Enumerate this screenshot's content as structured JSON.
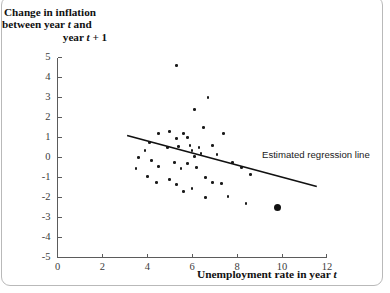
{
  "figure": {
    "y_axis_title_line1": "Change in inflation",
    "y_axis_title_line2_a": "between year ",
    "y_axis_title_line2_t": "t",
    "y_axis_title_line2_b": " and",
    "y_axis_title_line3_a": "year ",
    "y_axis_title_line3_t": "t",
    "y_axis_title_line3_b": " + 1",
    "x_axis_title_a": "Unemployment rate in year ",
    "x_axis_title_t": "t",
    "annotation": "Estimated regression line"
  },
  "chart_data": {
    "type": "scatter",
    "title": "",
    "xlabel": "Unemployment rate in year t",
    "ylabel": "Change in inflation between year t and year t + 1",
    "xlim": [
      0,
      12
    ],
    "ylim": [
      -5,
      5
    ],
    "xticks": [
      0,
      2,
      4,
      6,
      8,
      10,
      12
    ],
    "yticks": [
      -5,
      -4,
      -3,
      -2,
      -1,
      0,
      1,
      2,
      3,
      4,
      5
    ],
    "grid": false,
    "legend": "none",
    "annotations": [
      {
        "text": "Estimated regression line",
        "x": 9.1,
        "y": -0.35
      }
    ],
    "series": [
      {
        "name": "observations",
        "marker": "filled-circle",
        "color": "#1a1a1a",
        "points": [
          [
            5.3,
            4.6
          ],
          [
            6.7,
            3.0
          ],
          [
            6.1,
            2.4
          ],
          [
            6.5,
            1.5
          ],
          [
            4.5,
            1.2
          ],
          [
            5.0,
            1.3
          ],
          [
            5.6,
            1.2
          ],
          [
            5.3,
            0.95
          ],
          [
            5.8,
            1.0
          ],
          [
            7.4,
            1.2
          ],
          [
            4.1,
            0.75
          ],
          [
            4.9,
            0.5
          ],
          [
            3.9,
            0.35
          ],
          [
            5.4,
            0.55
          ],
          [
            5.9,
            0.6
          ],
          [
            6.0,
            0.35
          ],
          [
            6.3,
            0.5
          ],
          [
            6.4,
            0.2
          ],
          [
            6.9,
            0.6
          ],
          [
            7.1,
            0.15
          ],
          [
            6.1,
            0.05
          ],
          [
            3.6,
            0.0
          ],
          [
            4.2,
            -0.15
          ],
          [
            4.5,
            -0.45
          ],
          [
            5.2,
            -0.25
          ],
          [
            5.5,
            -0.55
          ],
          [
            5.8,
            -0.3
          ],
          [
            6.2,
            -0.5
          ],
          [
            7.8,
            -0.25
          ],
          [
            8.2,
            -0.5
          ],
          [
            4.0,
            -0.95
          ],
          [
            4.4,
            -1.25
          ],
          [
            5.0,
            -1.1
          ],
          [
            5.3,
            -1.35
          ],
          [
            6.6,
            -1.0
          ],
          [
            6.9,
            -1.25
          ],
          [
            7.3,
            -1.3
          ],
          [
            3.5,
            -0.55
          ],
          [
            8.6,
            -0.85
          ],
          [
            7.6,
            -1.95
          ],
          [
            8.4,
            -2.3
          ],
          [
            6.0,
            -1.55
          ],
          [
            6.6,
            -2.0
          ],
          [
            5.6,
            -1.7
          ],
          [
            9.8,
            -2.5
          ]
        ],
        "emphasized_point": [
          9.8,
          -2.5
        ]
      }
    ],
    "regression_line": {
      "name": "Estimated regression line",
      "x_start": 3.1,
      "y_start": 1.1,
      "x_end": 11.55,
      "y_end": -1.45,
      "color": "#111111"
    }
  }
}
